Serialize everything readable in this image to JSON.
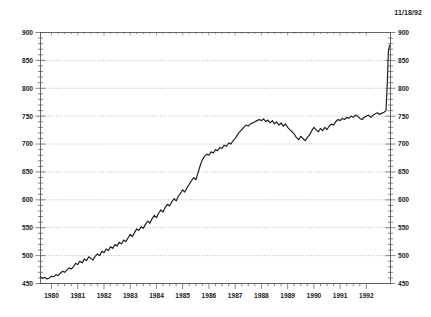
{
  "date_stamp": "11/18/92",
  "colors": {
    "line": "#1a1a1a",
    "axis": "#555555",
    "grid": "#999999",
    "background": "#ffffff",
    "text": "#1a1a1a"
  },
  "chart_data": {
    "type": "line",
    "title": "",
    "subtitle": "",
    "xlabel": "",
    "ylabel": "",
    "annotations": [
      "11/18/92"
    ],
    "grid": true,
    "grid_style": "dotted-horizontal",
    "legend": "none",
    "dual_y_axis": true,
    "xlim": [
      1979.58,
      1992.92
    ],
    "ylim": [
      450,
      900
    ],
    "yticks": [
      450,
      500,
      550,
      600,
      650,
      700,
      750,
      800,
      850,
      900
    ],
    "ytick_labels": [
      "450",
      "500",
      "550",
      "600",
      "650",
      "700",
      "750",
      "800",
      "850",
      "900"
    ],
    "y_minor_tick_interval": 10,
    "xticks": [
      1980,
      1981,
      1982,
      1983,
      1984,
      1985,
      1986,
      1987,
      1988,
      1989,
      1990,
      1991,
      1992
    ],
    "xtick_labels": [
      "1980",
      "1981",
      "1982",
      "1983",
      "1984",
      "1985",
      "1986",
      "1987",
      "1988",
      "1989",
      "1990",
      "1991",
      "1992"
    ],
    "x_minor_tick_interval": 0.25,
    "series": [
      {
        "name": "index",
        "x": [
          1979.58,
          1979.67,
          1979.75,
          1979.83,
          1979.92,
          1980.0,
          1980.08,
          1980.17,
          1980.25,
          1980.33,
          1980.42,
          1980.5,
          1980.58,
          1980.67,
          1980.75,
          1980.83,
          1980.92,
          1981.0,
          1981.08,
          1981.17,
          1981.25,
          1981.33,
          1981.42,
          1981.5,
          1981.58,
          1981.67,
          1981.75,
          1981.83,
          1981.92,
          1982.0,
          1982.08,
          1982.17,
          1982.25,
          1982.33,
          1982.42,
          1982.5,
          1982.58,
          1982.67,
          1982.75,
          1982.83,
          1982.92,
          1983.0,
          1983.08,
          1983.17,
          1983.25,
          1983.33,
          1983.42,
          1983.5,
          1983.58,
          1983.67,
          1983.75,
          1983.83,
          1983.92,
          1984.0,
          1984.08,
          1984.17,
          1984.25,
          1984.33,
          1984.42,
          1984.5,
          1984.58,
          1984.67,
          1984.75,
          1984.83,
          1984.92,
          1985.0,
          1985.08,
          1985.17,
          1985.25,
          1985.33,
          1985.42,
          1985.5,
          1985.58,
          1985.67,
          1985.75,
          1985.83,
          1985.92,
          1986.0,
          1986.08,
          1986.17,
          1986.25,
          1986.33,
          1986.42,
          1986.5,
          1986.58,
          1986.67,
          1986.75,
          1986.83,
          1986.92,
          1987.0,
          1987.08,
          1987.17,
          1987.25,
          1987.33,
          1987.42,
          1987.5,
          1987.58,
          1987.67,
          1987.75,
          1987.83,
          1987.92,
          1988.0,
          1988.08,
          1988.17,
          1988.25,
          1988.33,
          1988.42,
          1988.5,
          1988.58,
          1988.67,
          1988.75,
          1988.83,
          1988.92,
          1989.0,
          1989.08,
          1989.17,
          1989.25,
          1989.33,
          1989.42,
          1989.5,
          1989.58,
          1989.67,
          1989.75,
          1989.83,
          1989.92,
          1990.0,
          1990.08,
          1990.17,
          1990.25,
          1990.33,
          1990.42,
          1990.5,
          1990.58,
          1990.67,
          1990.75,
          1990.83,
          1990.92,
          1991.0,
          1991.08,
          1991.17,
          1991.25,
          1991.33,
          1991.42,
          1991.5,
          1991.58,
          1991.67,
          1991.75,
          1991.83,
          1991.92,
          1992.0,
          1992.08,
          1992.17,
          1992.25,
          1992.33,
          1992.42,
          1992.5,
          1992.58,
          1992.67,
          1992.75,
          1992.8,
          1992.84,
          1992.88
        ],
        "y": [
          462,
          459,
          461,
          458,
          460,
          463,
          462,
          466,
          464,
          468,
          472,
          470,
          474,
          478,
          476,
          480,
          486,
          484,
          490,
          487,
          494,
          491,
          498,
          495,
          492,
          499,
          503,
          500,
          508,
          505,
          512,
          509,
          516,
          513,
          520,
          517,
          524,
          521,
          528,
          525,
          532,
          538,
          534,
          542,
          548,
          545,
          552,
          549,
          556,
          562,
          558,
          566,
          572,
          568,
          576,
          582,
          578,
          586,
          592,
          589,
          596,
          602,
          598,
          606,
          612,
          618,
          614,
          622,
          628,
          634,
          640,
          636,
          648,
          662,
          672,
          678,
          682,
          680,
          686,
          684,
          690,
          688,
          694,
          692,
          698,
          696,
          702,
          700,
          706,
          710,
          716,
          722,
          726,
          730,
          734,
          732,
          736,
          738,
          740,
          742,
          744,
          742,
          745,
          740,
          743,
          738,
          742,
          736,
          740,
          734,
          738,
          732,
          736,
          730,
          726,
          722,
          718,
          712,
          708,
          714,
          710,
          706,
          712,
          716,
          724,
          730,
          726,
          722,
          728,
          724,
          730,
          726,
          732,
          736,
          734,
          740,
          744,
          742,
          746,
          744,
          748,
          746,
          750,
          748,
          752,
          750,
          746,
          744,
          748,
          750,
          752,
          748,
          752,
          754,
          756,
          753,
          755,
          757,
          760,
          812,
          866,
          877
        ]
      }
    ]
  }
}
